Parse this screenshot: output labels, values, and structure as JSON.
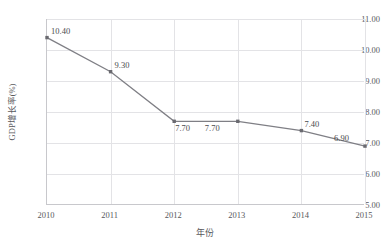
{
  "chart_data": {
    "type": "line",
    "title": "",
    "xlabel": "年份",
    "ylabel": "GDP增长率(%)",
    "x": [
      "2010",
      "2011",
      "2012",
      "2013",
      "2014",
      "2015"
    ],
    "categories": [
      "2010",
      "2011",
      "2012",
      "2013",
      "2014",
      "2015"
    ],
    "values": [
      10.4,
      9.3,
      7.7,
      7.7,
      7.4,
      6.9
    ],
    "point_labels": [
      "10.40",
      "9.30",
      "7.70",
      "7.70",
      "7.40",
      "6.90"
    ],
    "series": [
      {
        "name": "GDP增长率(%)",
        "values": [
          10.4,
          9.3,
          7.7,
          7.7,
          7.4,
          6.9
        ]
      }
    ],
    "ylim": [
      5.0,
      11.0
    ],
    "ytick_labels": [
      "11.00",
      "10.00",
      "9.00",
      "8.00",
      "7.00",
      "6.00",
      "5.00"
    ],
    "ytick_values": [
      11.0,
      10.0,
      9.0,
      8.0,
      7.0,
      6.0,
      5.0
    ],
    "xtick_labels": [
      "2010",
      "2011",
      "2012",
      "2013",
      "2014",
      "2015"
    ],
    "grid": true,
    "grid_axes": "both",
    "legend": false,
    "legend_position": "none",
    "marker": "square",
    "colors": {
      "line": "#7f7f85",
      "marker": "#6a6a70",
      "grid": "#e3e3e6",
      "axis": "#c8c8cc",
      "text": "#58585c",
      "background": "#ffffff"
    }
  }
}
